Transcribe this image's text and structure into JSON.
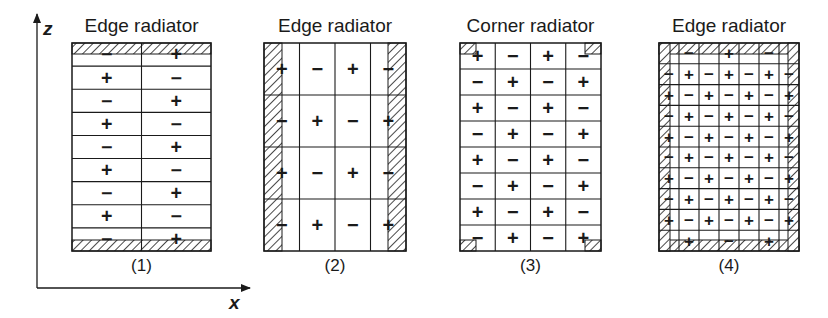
{
  "figure": {
    "axes": {
      "z_label": "z",
      "x_label": "x"
    },
    "panels": [
      {
        "id": "1",
        "title": "Edge radiator",
        "caption": "(1)",
        "box": {
          "x": 72,
          "y": 43,
          "w": 139,
          "h": 208
        },
        "grid": {
          "cols": 2,
          "rows": 9
        },
        "cells": [
          [
            "-",
            "+"
          ],
          [
            "+",
            "-"
          ],
          [
            "-",
            "+"
          ],
          [
            "+",
            "-"
          ],
          [
            "-",
            "+"
          ],
          [
            "+",
            "-"
          ],
          [
            "-",
            "+"
          ],
          [
            "+",
            "-"
          ],
          [
            "-",
            "+"
          ]
        ],
        "conductors": [
          {
            "side": "top",
            "thickness": 11
          },
          {
            "side": "bottom",
            "thickness": 11
          }
        ]
      },
      {
        "id": "2",
        "title": "Edge radiator",
        "caption": "(2)",
        "box": {
          "x": 264,
          "y": 43,
          "w": 142,
          "h": 208
        },
        "grid": {
          "cols": 4,
          "rows": 4
        },
        "cells": [
          [
            "+",
            "-",
            "+",
            "-"
          ],
          [
            "-",
            "+",
            "-",
            "+"
          ],
          [
            "+",
            "-",
            "+",
            "-"
          ],
          [
            "-",
            "+",
            "-",
            "+"
          ]
        ],
        "conductors": [
          {
            "side": "left",
            "thickness": 18
          },
          {
            "side": "right",
            "thickness": 18
          }
        ]
      },
      {
        "id": "3",
        "title": "Corner radiator",
        "caption": "(3)",
        "box": {
          "x": 460,
          "y": 43,
          "w": 141,
          "h": 208
        },
        "grid": {
          "cols": 4,
          "rows": 8
        },
        "cells": [
          [
            "+",
            "-",
            "+",
            "-"
          ],
          [
            "-",
            "+",
            "-",
            "+"
          ],
          [
            "+",
            "-",
            "+",
            "-"
          ],
          [
            "-",
            "+",
            "-",
            "+"
          ],
          [
            "+",
            "-",
            "+",
            "-"
          ],
          [
            "-",
            "+",
            "-",
            "+"
          ],
          [
            "+",
            "-",
            "+",
            "-"
          ],
          [
            "-",
            "+",
            "-",
            "+"
          ]
        ],
        "conductors": [
          {
            "side": "corner-tl",
            "size": 16,
            "h": 11
          },
          {
            "side": "corner-tr",
            "size": 16,
            "h": 11
          },
          {
            "side": "corner-bl",
            "size": 16,
            "h": 11
          },
          {
            "side": "corner-br",
            "size": 16,
            "h": 11
          }
        ]
      },
      {
        "id": "4",
        "title": "Edge radiator",
        "caption": "(4)",
        "box": {
          "x": 659,
          "y": 43,
          "w": 140,
          "h": 208
        },
        "grid": {
          "cols": 7,
          "rows": 10
        },
        "cells": [
          [
            "",
            "-",
            "",
            "+",
            "",
            "-",
            ""
          ],
          [
            "-",
            "+",
            "-",
            "+",
            "-",
            "+",
            "-"
          ],
          [
            "+",
            "-",
            "+",
            "-",
            "+",
            "-",
            "+"
          ],
          [
            "-",
            "+",
            "-",
            "+",
            "-",
            "+",
            "-"
          ],
          [
            "+",
            "-",
            "+",
            "-",
            "+",
            "-",
            "+"
          ],
          [
            "-",
            "+",
            "-",
            "+",
            "-",
            "+",
            "-"
          ],
          [
            "+",
            "-",
            "+",
            "-",
            "+",
            "-",
            "+"
          ],
          [
            "-",
            "+",
            "-",
            "+",
            "-",
            "+",
            "-"
          ],
          [
            "+",
            "-",
            "+",
            "-",
            "+",
            "-",
            "+"
          ],
          [
            "",
            "+",
            "",
            "-",
            "",
            "+",
            ""
          ]
        ],
        "conductors": [
          {
            "side": "top",
            "thickness": 11
          },
          {
            "side": "bottom",
            "thickness": 11
          },
          {
            "side": "left",
            "thickness": 11
          },
          {
            "side": "right",
            "thickness": 11
          }
        ]
      }
    ]
  }
}
